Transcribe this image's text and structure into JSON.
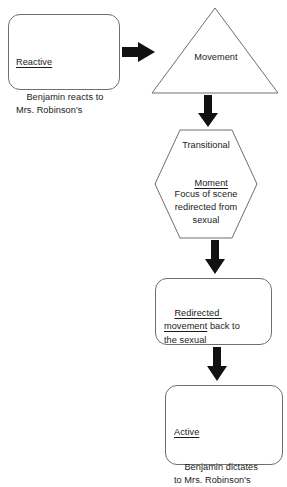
{
  "diagram": {
    "background_color": "#ffffff",
    "outline_color": "#6e6e6e",
    "arrow_color": "#111111",
    "text_color": "#1a1a1a"
  },
  "nodes": {
    "reactive_box": {
      "shape": "rounded-rectangle",
      "heading": "Reactive",
      "body": "Benjamin reacts to\nMrs. Robinson's"
    },
    "movement_triangle": {
      "shape": "triangle",
      "label": "Movement"
    },
    "transitional_hexagon": {
      "shape": "hexagon",
      "line1": "Transitional",
      "line2": "Moment",
      "body": "Focus of scene\nredirected from\nsexual"
    },
    "redirected_box": {
      "shape": "rounded-rectangle",
      "underlined_part": "Redirected \nmovement",
      "rest": " back to\nthe sexual"
    },
    "active_box": {
      "shape": "rounded-rectangle",
      "heading": "Active",
      "body": "Benjamin dictates\nto Mrs. Robinson's"
    }
  },
  "arrows": {
    "reactive_to_movement": {
      "direction": "right"
    },
    "movement_to_transitional": {
      "direction": "down"
    },
    "transitional_to_redirected": {
      "direction": "down"
    },
    "redirected_to_active": {
      "direction": "down"
    }
  }
}
